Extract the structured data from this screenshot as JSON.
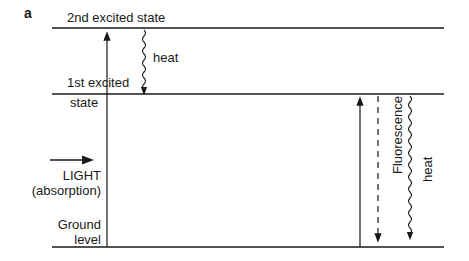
{
  "panel_label": "a",
  "levels": {
    "second_excited": "2nd excited state",
    "first_excited_line1": "1st excited",
    "first_excited_line2": "state",
    "ground_line1": "Ground",
    "ground_line2": "level"
  },
  "labels": {
    "heat_top": "heat",
    "light_line1": "LIGHT",
    "light_line2": "(absorption)",
    "fluorescence": "Fluorescence",
    "heat_right": "heat"
  },
  "colors": {
    "line": "#1a1a1a",
    "background": "#ffffff"
  }
}
